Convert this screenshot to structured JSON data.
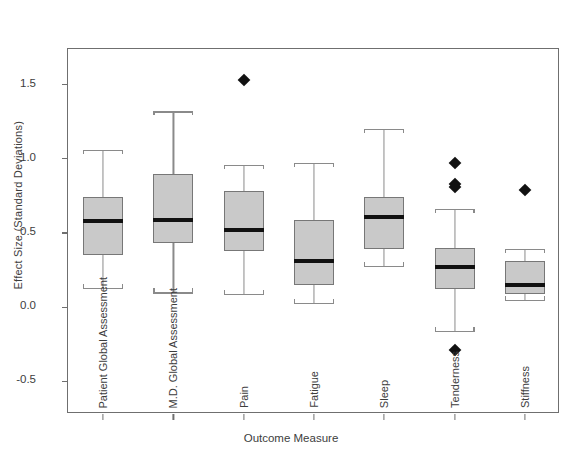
{
  "chart_data": {
    "type": "box",
    "title": "",
    "xlabel": "Outcome Measure",
    "ylabel": "Effect Size (Standard Deviations)",
    "ylim": [
      -0.72,
      1.74
    ],
    "yticks": [
      1.5,
      1.0,
      0.5,
      0.0,
      -0.5
    ],
    "ytick_labels": [
      "1.5",
      "1.0",
      "0.5",
      "0.0",
      "-0.5"
    ],
    "grid": false,
    "legend": "none",
    "categories": [
      "Patient Global Assessment",
      "M.D. Global Assessment",
      "Pain",
      "Fatigue",
      "Sleep",
      "Tenderness",
      "Stiffness"
    ],
    "boxes": [
      {
        "category": "Patient Global Assessment",
        "whisker_low": 0.13,
        "q1": 0.35,
        "median": 0.58,
        "q3": 0.74,
        "whisker_high": 1.06,
        "outliers": []
      },
      {
        "category": "M.D. Global Assessment",
        "whisker_low": 0.1,
        "q1": 0.43,
        "median": 0.59,
        "q3": 0.9,
        "whisker_high": 1.32,
        "outliers": []
      },
      {
        "category": "Pain",
        "whisker_low": 0.09,
        "q1": 0.38,
        "median": 0.52,
        "q3": 0.78,
        "whisker_high": 0.96,
        "outliers": [
          1.53
        ]
      },
      {
        "category": "Fatigue",
        "whisker_low": 0.03,
        "q1": 0.15,
        "median": 0.31,
        "q3": 0.59,
        "whisker_high": 0.97,
        "outliers": []
      },
      {
        "category": "Sleep",
        "whisker_low": 0.28,
        "q1": 0.39,
        "median": 0.61,
        "q3": 0.74,
        "whisker_high": 1.2,
        "outliers": []
      },
      {
        "category": "Tenderness",
        "whisker_low": -0.16,
        "q1": 0.12,
        "median": 0.27,
        "q3": 0.4,
        "whisker_high": 0.66,
        "outliers": [
          0.97,
          0.83,
          0.81,
          -0.29
        ]
      },
      {
        "category": "Stiffness",
        "whisker_low": 0.05,
        "q1": 0.09,
        "median": 0.15,
        "q3": 0.31,
        "whisker_high": 0.39,
        "outliers": [
          0.79
        ]
      }
    ],
    "colors": {
      "box_fill": "#c9c9c9",
      "box_edge": "#777777",
      "median": "#111111",
      "whisker": "#8a8a8a",
      "outlier": "#111111",
      "frame": "#6f6f6f",
      "text": "#3d3d3d",
      "background": "#ffffff"
    }
  }
}
